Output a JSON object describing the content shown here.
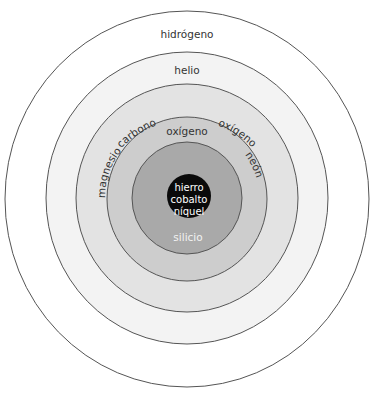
{
  "diagram": {
    "type": "concentric-layers",
    "layers": [
      {
        "id": "layer-1",
        "label": "hidrógeno",
        "fill": "#ffffff"
      },
      {
        "id": "layer-2",
        "label": "helio",
        "fill": "#f3f3f3"
      },
      {
        "id": "layer-3",
        "labels": [
          "carbono",
          "oxígeno"
        ],
        "fill": "#e3e3e3"
      },
      {
        "id": "layer-4",
        "labels": [
          "magnesio",
          "oxígeno",
          "neón"
        ],
        "fill": "#cdcdcd"
      },
      {
        "id": "layer-5",
        "label": "silicio",
        "fill": "#a9a9a9"
      },
      {
        "id": "core",
        "labels": [
          "hierro",
          "cobalto",
          "níquel"
        ],
        "fill": "#0a0a0a"
      }
    ],
    "outline_color": "#555555"
  }
}
